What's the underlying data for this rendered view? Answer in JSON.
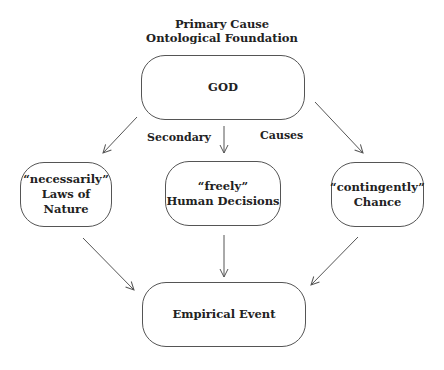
{
  "header": {
    "line1": "Primary Cause",
    "line2": "Ontological Foundation"
  },
  "nodes": {
    "god": {
      "label": "GOD"
    },
    "laws": {
      "line1": "“necessarily”",
      "line2": "Laws of Nature"
    },
    "human": {
      "line1": "“freely”",
      "line2": "Human Decisions"
    },
    "chance": {
      "line1": "“contingently”",
      "line2": "Chance"
    },
    "event": {
      "label": "Empirical Event"
    }
  },
  "edge_labels": {
    "left": "Secondary",
    "right": "Causes"
  },
  "edges": [
    {
      "from": "god",
      "to": "laws"
    },
    {
      "from": "god",
      "to": "human"
    },
    {
      "from": "god",
      "to": "chance"
    },
    {
      "from": "laws",
      "to": "event"
    },
    {
      "from": "human",
      "to": "event"
    },
    {
      "from": "chance",
      "to": "event"
    }
  ]
}
